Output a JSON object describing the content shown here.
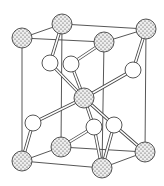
{
  "diagram": {
    "type": "crystal-unit-cell",
    "colors": {
      "background": "#ffffff",
      "line": "#444444",
      "dotted_atom_fill": "#e8e8e8",
      "dot": "#333333",
      "open_atom_fill": "#ffffff"
    },
    "dotted_atoms": [
      {
        "id": "A",
        "x": 22,
        "y": 38,
        "r": 10
      },
      {
        "id": "B",
        "x": 62,
        "y": 24,
        "r": 10
      },
      {
        "id": "C",
        "x": 146,
        "y": 29,
        "r": 10
      },
      {
        "id": "D",
        "x": 104,
        "y": 42,
        "r": 10
      },
      {
        "id": "E",
        "x": 84,
        "y": 98,
        "r": 10
      },
      {
        "id": "F",
        "x": 22,
        "y": 161,
        "r": 10
      },
      {
        "id": "G",
        "x": 61,
        "y": 147,
        "r": 10
      },
      {
        "id": "H",
        "x": 145,
        "y": 152,
        "r": 10
      },
      {
        "id": "I",
        "x": 102,
        "y": 168,
        "r": 10
      }
    ],
    "open_atoms": [
      {
        "id": "a",
        "x": 50,
        "y": 63,
        "r": 8
      },
      {
        "id": "b",
        "x": 71,
        "y": 64,
        "r": 8
      },
      {
        "id": "c",
        "x": 133,
        "y": 70,
        "r": 8
      },
      {
        "id": "d",
        "x": 33,
        "y": 123,
        "r": 8
      },
      {
        "id": "e",
        "x": 94,
        "y": 127,
        "r": 8
      },
      {
        "id": "f",
        "x": 114,
        "y": 125,
        "r": 8
      }
    ],
    "cell_edges": [
      [
        "A",
        "B"
      ],
      [
        "B",
        "C"
      ],
      [
        "C",
        "D"
      ],
      [
        "A",
        "D"
      ],
      [
        "F",
        "G"
      ],
      [
        "G",
        "H"
      ],
      [
        "H",
        "I"
      ],
      [
        "I",
        "F"
      ],
      [
        "A",
        "F"
      ],
      [
        "B",
        "G"
      ],
      [
        "C",
        "H"
      ],
      [
        "D",
        "I"
      ]
    ],
    "bonds": [
      [
        "B",
        "a"
      ],
      [
        "D",
        "b"
      ],
      [
        "a",
        "E"
      ],
      [
        "b",
        "E"
      ],
      [
        "C",
        "c"
      ],
      [
        "c",
        "E"
      ],
      [
        "E",
        "d"
      ],
      [
        "d",
        "F"
      ],
      [
        "E",
        "e"
      ],
      [
        "E",
        "f"
      ],
      [
        "e",
        "G"
      ],
      [
        "e",
        "I"
      ],
      [
        "f",
        "I"
      ],
      [
        "f",
        "H"
      ]
    ]
  }
}
